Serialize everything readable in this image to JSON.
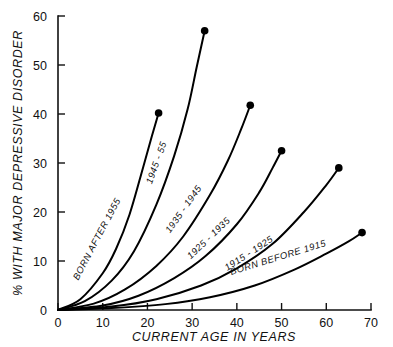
{
  "chart_data": {
    "type": "line",
    "title": "",
    "subtitle": "",
    "xlabel": "CURRENT AGE IN YEARS",
    "ylabel": "% WITH MAJOR DEPRESSIVE DISORDER",
    "xlim": [
      0,
      70
    ],
    "ylim": [
      0,
      60
    ],
    "xticks": [
      0,
      10,
      20,
      30,
      40,
      50,
      60,
      70
    ],
    "xticklabels": [
      "0",
      "10",
      "20",
      "30",
      "40",
      "50",
      "60",
      "70"
    ],
    "yticks": [
      0,
      10,
      20,
      30,
      40,
      50,
      60
    ],
    "yticklabels": [
      "0",
      "10",
      "20",
      "30",
      "40",
      "50",
      "60"
    ],
    "grid": false,
    "legend": "inline-curve-labels",
    "marker": "filled-circle-at-endpoint",
    "series": [
      {
        "name": "BORN AFTER 1955",
        "label": "BORN AFTER 1955",
        "endpoint": {
          "x": 22.5,
          "y": 40.2
        },
        "x": [
          0,
          5,
          10,
          13,
          16,
          19,
          21,
          22.5
        ],
        "y": [
          0,
          2.2,
          7.5,
          12.5,
          19.5,
          29.0,
          35.5,
          40.2
        ]
      },
      {
        "name": "1945-55",
        "label": "1945 - 55",
        "endpoint": {
          "x": 32.8,
          "y": 57.0
        },
        "x": [
          0,
          6,
          12,
          17,
          22,
          26,
          29,
          31,
          32.8
        ],
        "y": [
          0,
          1.8,
          6.0,
          12.0,
          21.5,
          31.5,
          41.0,
          49.5,
          57.0
        ]
      },
      {
        "name": "1935-1945",
        "label": "1935 - 1945",
        "endpoint": {
          "x": 43.0,
          "y": 41.8
        },
        "x": [
          0,
          8,
          15,
          22,
          28,
          34,
          38,
          41,
          43
        ],
        "y": [
          0,
          1.3,
          4.2,
          9.0,
          15.0,
          23.5,
          30.5,
          37.0,
          41.8
        ]
      },
      {
        "name": "1925-1935",
        "label": "1925 - 1935",
        "endpoint": {
          "x": 50.0,
          "y": 32.5
        },
        "x": [
          0,
          10,
          18,
          26,
          33,
          40,
          45,
          48,
          50
        ],
        "y": [
          0,
          0.9,
          2.9,
          6.5,
          11.0,
          17.5,
          24.0,
          29.0,
          32.5
        ]
      },
      {
        "name": "1915-1925",
        "label": "1915 - 1925",
        "endpoint": {
          "x": 62.8,
          "y": 29.0
        },
        "x": [
          0,
          12,
          22,
          32,
          40,
          48,
          55,
          60,
          62.8
        ],
        "y": [
          0,
          0.7,
          2.2,
          5.0,
          8.5,
          13.5,
          20.0,
          25.5,
          29.0
        ]
      },
      {
        "name": "BORN BEFORE 1915",
        "label": "BORN BEFORE 1915",
        "endpoint": {
          "x": 68.0,
          "y": 15.8
        },
        "x": [
          0,
          12,
          24,
          34,
          44,
          53,
          60,
          65,
          68
        ],
        "y": [
          0,
          0.4,
          1.2,
          2.6,
          5.0,
          8.3,
          11.5,
          14.0,
          15.8
        ]
      }
    ],
    "annotations": [
      {
        "name": "minor-tick-near-10",
        "x": 10,
        "y": 1.2
      }
    ],
    "colors": {
      "line": "#000000",
      "axis": "#111111",
      "background": "#ffffff",
      "text": "#111111"
    }
  }
}
